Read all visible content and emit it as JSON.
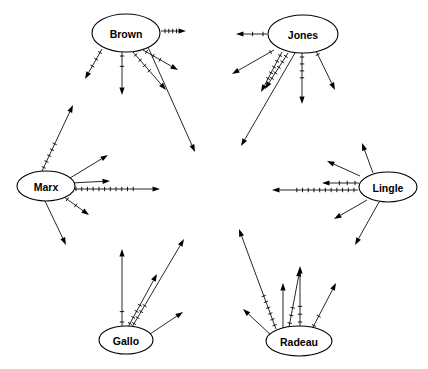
{
  "diagram": {
    "type": "directed-graph",
    "width": 428,
    "height": 369,
    "background_color": "#ffffff",
    "line_color": "#000000",
    "node_fill_color": "#ffffff",
    "node_count": 6,
    "nodes": [
      {
        "id": "brown",
        "label": "Brown",
        "cx": 126,
        "cy": 33,
        "rx": 34,
        "ry": 19
      },
      {
        "id": "jones",
        "label": "Jones",
        "cx": 303,
        "cy": 34,
        "rx": 35,
        "ry": 19
      },
      {
        "id": "marx",
        "label": "Marx",
        "cx": 46,
        "cy": 186,
        "rx": 29,
        "ry": 15
      },
      {
        "id": "lingle",
        "label": "Lingle",
        "cx": 388,
        "cy": 187,
        "rx": 29,
        "ry": 15
      },
      {
        "id": "gallo",
        "label": "Gallo",
        "cx": 126,
        "cy": 340,
        "rx": 27,
        "ry": 14
      },
      {
        "id": "radeau",
        "label": "Radeau",
        "cx": 299,
        "cy": 341,
        "rx": 33,
        "ry": 15
      }
    ],
    "edges": [
      {
        "from": "brown",
        "x1": 161,
        "y1": 31,
        "x2": 186,
        "y2": 31,
        "ticks": 4
      },
      {
        "from": "brown",
        "x1": 102,
        "y1": 49,
        "x2": 85,
        "y2": 79,
        "ticks": 3
      },
      {
        "from": "brown",
        "x1": 122,
        "y1": 52,
        "x2": 122,
        "y2": 95,
        "ticks": 2
      },
      {
        "from": "brown",
        "x1": 133,
        "y1": 52,
        "x2": 166,
        "y2": 90,
        "ticks": 4
      },
      {
        "from": "brown",
        "x1": 143,
        "y1": 50,
        "x2": 178,
        "y2": 70,
        "ticks": 3
      },
      {
        "from": "brown",
        "x1": 148,
        "y1": 47,
        "x2": 195,
        "y2": 152,
        "ticks": 0
      },
      {
        "from": "jones",
        "x1": 267,
        "y1": 34,
        "x2": 236,
        "y2": 34,
        "ticks": 2
      },
      {
        "from": "jones",
        "x1": 274,
        "y1": 50,
        "x2": 232,
        "y2": 74,
        "ticks": 1
      },
      {
        "from": "jones",
        "x1": 282,
        "y1": 52,
        "x2": 261,
        "y2": 92,
        "ticks": 5
      },
      {
        "from": "jones",
        "x1": 288,
        "y1": 53,
        "x2": 265,
        "y2": 89,
        "ticks": 5
      },
      {
        "from": "jones",
        "x1": 295,
        "y1": 53,
        "x2": 241,
        "y2": 146,
        "ticks": 0
      },
      {
        "from": "jones",
        "x1": 302,
        "y1": 53,
        "x2": 302,
        "y2": 104,
        "ticks": 4
      },
      {
        "from": "jones",
        "x1": 316,
        "y1": 51,
        "x2": 335,
        "y2": 90,
        "ticks": 1
      },
      {
        "from": "marx",
        "x1": 42,
        "y1": 171,
        "x2": 73,
        "y2": 105,
        "ticks": 5
      },
      {
        "from": "marx",
        "x1": 70,
        "y1": 178,
        "x2": 108,
        "y2": 155,
        "ticks": 0
      },
      {
        "from": "marx",
        "x1": 71,
        "y1": 183,
        "x2": 110,
        "y2": 181,
        "ticks": 0
      },
      {
        "from": "marx",
        "x1": 72,
        "y1": 189,
        "x2": 160,
        "y2": 189,
        "ticks": 11
      },
      {
        "from": "marx",
        "x1": 64,
        "y1": 197,
        "x2": 89,
        "y2": 215,
        "ticks": 2
      },
      {
        "from": "marx",
        "x1": 45,
        "y1": 201,
        "x2": 66,
        "y2": 245,
        "ticks": 0
      },
      {
        "from": "lingle",
        "x1": 360,
        "y1": 176,
        "x2": 327,
        "y2": 161,
        "ticks": 0
      },
      {
        "from": "lingle",
        "x1": 359,
        "y1": 183,
        "x2": 322,
        "y2": 183,
        "ticks": 3
      },
      {
        "from": "lingle",
        "x1": 358,
        "y1": 190,
        "x2": 272,
        "y2": 190,
        "ticks": 11
      },
      {
        "from": "lingle",
        "x1": 373,
        "y1": 173,
        "x2": 362,
        "y2": 143,
        "ticks": 0
      },
      {
        "from": "lingle",
        "x1": 367,
        "y1": 200,
        "x2": 334,
        "y2": 219,
        "ticks": 0
      },
      {
        "from": "lingle",
        "x1": 379,
        "y1": 202,
        "x2": 355,
        "y2": 245,
        "ticks": 0
      },
      {
        "from": "gallo",
        "x1": 122,
        "y1": 326,
        "x2": 122,
        "y2": 249,
        "ticks": 2
      },
      {
        "from": "gallo",
        "x1": 128,
        "y1": 327,
        "x2": 157,
        "y2": 274,
        "ticks": 4
      },
      {
        "from": "gallo",
        "x1": 132,
        "y1": 327,
        "x2": 184,
        "y2": 239,
        "ticks": 4
      },
      {
        "from": "gallo",
        "x1": 150,
        "y1": 334,
        "x2": 183,
        "y2": 312,
        "ticks": 0
      },
      {
        "from": "radeau",
        "x1": 276,
        "y1": 329,
        "x2": 239,
        "y2": 229,
        "ticks": 6
      },
      {
        "from": "radeau",
        "x1": 283,
        "y1": 328,
        "x2": 283,
        "y2": 283,
        "ticks": 0
      },
      {
        "from": "radeau",
        "x1": 289,
        "y1": 327,
        "x2": 300,
        "y2": 269,
        "ticks": 3
      },
      {
        "from": "radeau",
        "x1": 300,
        "y1": 326,
        "x2": 300,
        "y2": 266,
        "ticks": 3
      },
      {
        "from": "radeau",
        "x1": 312,
        "y1": 329,
        "x2": 336,
        "y2": 283,
        "ticks": 2
      },
      {
        "from": "radeau",
        "x1": 272,
        "y1": 336,
        "x2": 243,
        "y2": 309,
        "ticks": 0
      }
    ]
  }
}
